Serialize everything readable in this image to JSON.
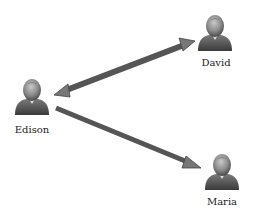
{
  "nodes": [
    {
      "id": "edison",
      "label": "Edison",
      "icon": "person-icon",
      "x": 32,
      "y": 97
    },
    {
      "id": "david",
      "label": "David",
      "icon": "person-icon",
      "x": 215,
      "y": 40
    },
    {
      "id": "maria",
      "label": "Maria",
      "icon": "person-icon",
      "x": 222,
      "y": 166
    }
  ],
  "edges": [
    {
      "from": "edison",
      "to": "david",
      "direction": "bidirectional"
    },
    {
      "from": "edison",
      "to": "maria",
      "direction": "forward"
    }
  ],
  "colors": {
    "arrow": "#555555",
    "arrow_head": "#777777",
    "person_dark": "#4a4a4a",
    "person_light": "#a8a8a8"
  }
}
